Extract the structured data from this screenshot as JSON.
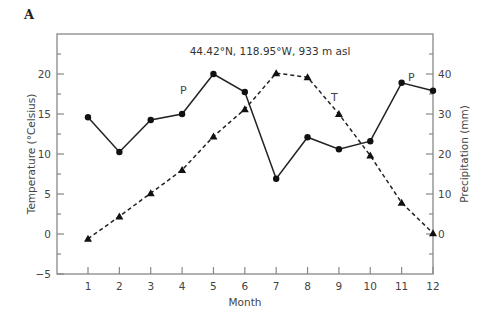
{
  "chart_data": {
    "type": "line",
    "panel_label": "A",
    "title": "",
    "annotation": "44.42°N, 118.95°W, 933 m asl",
    "xlabel": "Month",
    "ylabel_left": "Temperature (°Celsius)",
    "ylabel_right": "Precipitation (mm)",
    "x": [
      1,
      2,
      3,
      4,
      5,
      6,
      7,
      8,
      9,
      10,
      11,
      12
    ],
    "x_ticks": [
      "1",
      "2",
      "3",
      "4",
      "5",
      "6",
      "7",
      "8",
      "9",
      "10",
      "11",
      "12"
    ],
    "xlim": [
      0,
      12
    ],
    "ylim_left": [
      -5,
      25
    ],
    "ylim_right": [
      -10,
      50
    ],
    "y_ticks_left": [
      "-5",
      "0",
      "5",
      "10",
      "15",
      "20"
    ],
    "y_ticks_left_values": [
      -5,
      0,
      5,
      10,
      15,
      20
    ],
    "y_ticks_right": [
      "0",
      "10",
      "20",
      "30",
      "40"
    ],
    "y_ticks_right_values": [
      0,
      10,
      20,
      30,
      40
    ],
    "grid": false,
    "legend": "none (series labeled inline)",
    "series": [
      {
        "name": "T",
        "description": "Temperature",
        "axis": "left",
        "style": "dashed",
        "marker": "triangle",
        "label_positions": [
          {
            "text": "T",
            "near_month": 9
          }
        ],
        "values": [
          -0.6,
          2.2,
          5.1,
          8.0,
          12.2,
          15.6,
          20.1,
          19.6,
          15.0,
          9.8,
          3.9,
          0.1
        ]
      },
      {
        "name": "P",
        "description": "Precipitation",
        "axis": "right",
        "style": "solid",
        "marker": "circle",
        "label_positions": [
          {
            "text": "P",
            "near_month": 4
          },
          {
            "text": "P",
            "near_month": 11
          }
        ],
        "values": [
          29.2,
          20.5,
          28.5,
          30.0,
          40.0,
          35.5,
          13.8,
          24.2,
          21.2,
          23.2,
          37.8,
          35.8
        ]
      }
    ]
  }
}
